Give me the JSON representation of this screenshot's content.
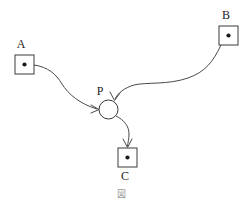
{
  "figure": {
    "title_glyph": "図",
    "background_color": "#ffffff",
    "stroke_color": "#4a4a4a",
    "label_color": "#1a1a1a",
    "caption_color": "#9a9a9a",
    "width": 251,
    "height": 215
  },
  "nodes": [
    {
      "id": "A",
      "label": "A",
      "shape": "square-with-dot",
      "x": 15,
      "y": 55,
      "size": 19,
      "label_x": 21,
      "label_y": 48
    },
    {
      "id": "B",
      "label": "B",
      "shape": "square-with-dot",
      "x": 219,
      "y": 26,
      "size": 19,
      "label_x": 225,
      "label_y": 19
    },
    {
      "id": "P",
      "label": "P",
      "shape": "circle",
      "cx": 108.5,
      "cy": 109.5,
      "r": 9.5,
      "label_x": 99,
      "label_y": 94
    },
    {
      "id": "C",
      "label": "C",
      "shape": "square-with-dot",
      "x": 118,
      "y": 148,
      "size": 19,
      "label_x": 124,
      "label_y": 180
    }
  ],
  "edges": [
    {
      "id": "A-to-P",
      "from": "A",
      "to": "P",
      "path": "M 34 65 C 48 67 56 74 62 84 C 68 94 80 104 97 109",
      "arrow": "M 91 105 L 99 109.5 L 91 113"
    },
    {
      "id": "B-to-P",
      "from": "B",
      "to": "P",
      "path": "M 221 45 C 213 62 205 72 188 78 C 168 85 146 82 134 85 C 124 88 118 93 115 99",
      "arrow": "M 110 92 L 114.5 100.5 L 120 93"
    },
    {
      "id": "P-to-C",
      "from": "P",
      "to": "C",
      "path": "M 116 116 C 124 120 129 126 129 134 C 129 139 128 142 127.5 146",
      "arrow": "M 123 139 L 127.5 147.5 L 132 139"
    }
  ],
  "caption": {
    "glyph": "図",
    "x": 121,
    "y": 196
  }
}
